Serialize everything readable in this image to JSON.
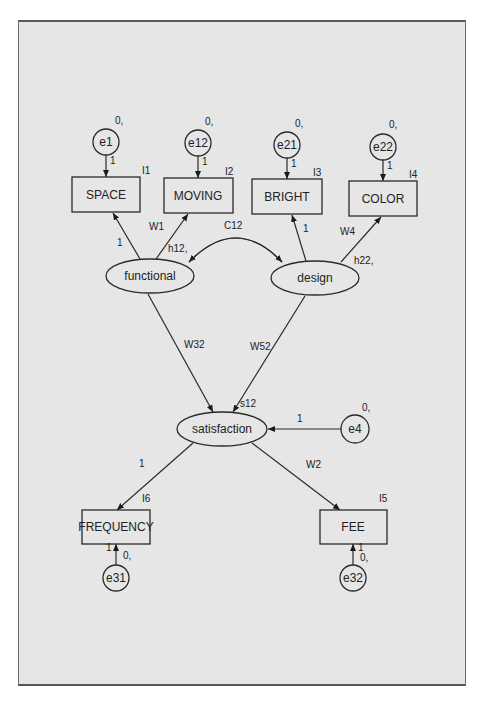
{
  "diagram": {
    "type": "structural-equation-model",
    "background": "#e6e6e6",
    "observed": [
      {
        "id": "space",
        "label": "SPACE",
        "intercept": "I1"
      },
      {
        "id": "moving",
        "label": "MOVING",
        "intercept": "I2"
      },
      {
        "id": "bright",
        "label": "BRIGHT",
        "intercept": "I3"
      },
      {
        "id": "color",
        "label": "COLOR",
        "intercept": "I4"
      },
      {
        "id": "frequency",
        "label": "FREQUENCY",
        "intercept": "I6"
      },
      {
        "id": "fee",
        "label": "FEE",
        "intercept": "I5"
      }
    ],
    "latent": [
      {
        "id": "functional",
        "label": "functional",
        "variance": "h12,"
      },
      {
        "id": "design",
        "label": "design",
        "variance": "h22,"
      },
      {
        "id": "satisfaction",
        "label": "satisfaction",
        "variance": "s12"
      }
    ],
    "errors": [
      {
        "id": "e1",
        "label": "e1",
        "param": "0,",
        "weight": "1"
      },
      {
        "id": "e12",
        "label": "e12",
        "param": "0,",
        "weight": "1"
      },
      {
        "id": "e21",
        "label": "e21",
        "param": "0,",
        "weight": "1"
      },
      {
        "id": "e22",
        "label": "e22",
        "param": "0,",
        "weight": "1"
      },
      {
        "id": "e4",
        "label": "e4",
        "param": "0,",
        "weight": "1"
      },
      {
        "id": "e31",
        "label": "e31",
        "param": "0,",
        "weight": "1"
      },
      {
        "id": "e32",
        "label": "e32",
        "param": "0,",
        "weight": "1"
      }
    ],
    "paths": [
      {
        "from": "functional",
        "to": "space",
        "label": "1"
      },
      {
        "from": "functional",
        "to": "moving",
        "label": "W1"
      },
      {
        "from": "design",
        "to": "bright",
        "label": "1"
      },
      {
        "from": "design",
        "to": "color",
        "label": "W4"
      },
      {
        "from": "functional",
        "to": "satisfaction",
        "label": "W32"
      },
      {
        "from": "design",
        "to": "satisfaction",
        "label": "W52"
      },
      {
        "from": "satisfaction",
        "to": "frequency",
        "label": "1"
      },
      {
        "from": "satisfaction",
        "to": "fee",
        "label": "W2"
      },
      {
        "from": "e4",
        "to": "satisfaction",
        "label": "1"
      }
    ],
    "covariances": [
      {
        "between": [
          "functional",
          "design"
        ],
        "label": "C12"
      }
    ]
  }
}
